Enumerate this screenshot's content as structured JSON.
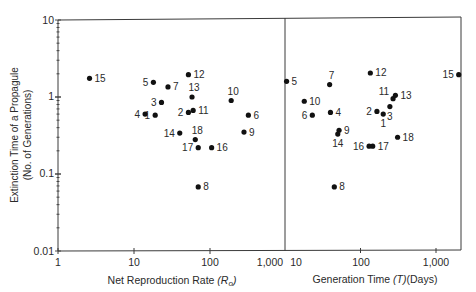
{
  "chart_data": [
    {
      "type": "scatter",
      "panel": "left",
      "xlabel": "Net Reproduction Rate (R_o)",
      "xlabel_main": "Net Reproduction Rate ",
      "xlabel_sym": "(R",
      "xlabel_sub": "o",
      "xlabel_close": ")",
      "ylabel": "Extinction Time of a Propagule (No. of Generations)",
      "ylabel_line1": "Extinction Time of a Propagule",
      "ylabel_line2": "(No. of Generations)",
      "xscale": "log",
      "yscale": "log",
      "xlim": [
        1,
        1000
      ],
      "ylim": [
        0.01,
        10
      ],
      "x_ticks": [
        "1",
        "10",
        "100",
        "1,000"
      ],
      "y_ticks": [
        "0.01",
        "0.1",
        "1",
        "10"
      ],
      "grid": false,
      "points": [
        {
          "label": "1",
          "x": 19,
          "y": 0.58
        },
        {
          "label": "2",
          "x": 52,
          "y": 0.63
        },
        {
          "label": "3",
          "x": 23,
          "y": 0.85
        },
        {
          "label": "4",
          "x": 14,
          "y": 0.6
        },
        {
          "label": "5",
          "x": 18,
          "y": 1.55
        },
        {
          "label": "6",
          "x": 320,
          "y": 0.58
        },
        {
          "label": "7",
          "x": 28,
          "y": 1.35
        },
        {
          "label": "8",
          "x": 70,
          "y": 0.068
        },
        {
          "label": "9",
          "x": 280,
          "y": 0.35
        },
        {
          "label": "10",
          "x": 190,
          "y": 0.9
        },
        {
          "label": "11",
          "x": 60,
          "y": 0.67
        },
        {
          "label": "12",
          "x": 52,
          "y": 1.95
        },
        {
          "label": "13",
          "x": 58,
          "y": 1.0
        },
        {
          "label": "14",
          "x": 40,
          "y": 0.34
        },
        {
          "label": "15",
          "x": 2.6,
          "y": 1.75
        },
        {
          "label": "16",
          "x": 105,
          "y": 0.22
        },
        {
          "label": "17",
          "x": 70,
          "y": 0.22
        },
        {
          "label": "18",
          "x": 64,
          "y": 0.28
        }
      ]
    },
    {
      "type": "scatter",
      "panel": "right",
      "xlabel": "Generation Time (T) (Days)",
      "xlabel_main": "Generation Time ",
      "xlabel_sym": "(T)",
      "xlabel_units": "(Days)",
      "ylabel": "Extinction Time of a Propagule (No. of Generations)",
      "xscale": "log",
      "yscale": "log",
      "xlim": [
        10,
        2150
      ],
      "ylim": [
        0.01,
        10
      ],
      "x_ticks": [
        "10",
        "100",
        "1,000"
      ],
      "grid": false,
      "points": [
        {
          "label": "1",
          "x": 200,
          "y": 0.6
        },
        {
          "label": "2",
          "x": 165,
          "y": 0.65
        },
        {
          "label": "3",
          "x": 245,
          "y": 0.75
        },
        {
          "label": "4",
          "x": 40,
          "y": 0.63
        },
        {
          "label": "5",
          "x": 10.5,
          "y": 1.6
        },
        {
          "label": "6",
          "x": 23,
          "y": 0.58
        },
        {
          "label": "7",
          "x": 39,
          "y": 1.45
        },
        {
          "label": "8",
          "x": 45,
          "y": 0.068
        },
        {
          "label": "9",
          "x": 52,
          "y": 0.37
        },
        {
          "label": "10",
          "x": 18,
          "y": 0.88
        },
        {
          "label": "11",
          "x": 270,
          "y": 0.95
        },
        {
          "label": "12",
          "x": 135,
          "y": 2.05
        },
        {
          "label": "13",
          "x": 290,
          "y": 1.05
        },
        {
          "label": "14",
          "x": 50,
          "y": 0.33
        },
        {
          "label": "15",
          "x": 2000,
          "y": 1.95
        },
        {
          "label": "16",
          "x": 130,
          "y": 0.23
        },
        {
          "label": "17",
          "x": 145,
          "y": 0.23
        },
        {
          "label": "18",
          "x": 310,
          "y": 0.3
        }
      ]
    }
  ],
  "labels": {
    "y_title_1": "Extinction Time of a Propagule",
    "y_title_2": "(No. of Generations)",
    "y_ticks": [
      "10",
      "1",
      "0.1",
      "0.01"
    ],
    "left_x_ticks": [
      "1",
      "10",
      "100",
      "1,000"
    ],
    "right_x_ticks": [
      "10",
      "100",
      "1,000"
    ],
    "left_xlabel": "Net Reproduction Rate ",
    "left_xlabel_sym": "(R",
    "left_xlabel_sub": "o",
    "left_xlabel_close": ")",
    "right_xlabel": "Generation Time ",
    "right_xlabel_sym": "(T)",
    "right_xlabel_units": "(Days)"
  },
  "colors": {
    "axis": "#3a3a3a",
    "point": "#111111",
    "text": "#2a2a2a"
  }
}
